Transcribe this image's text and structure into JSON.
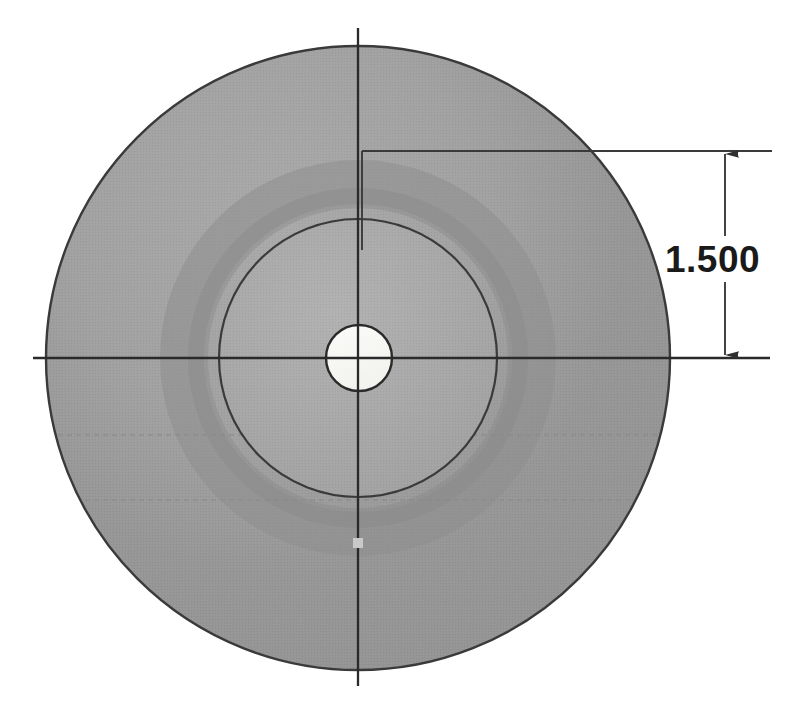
{
  "drawing": {
    "title": "Circular flange hub section view",
    "background_color": "#ffffff",
    "view_type": "front-view"
  },
  "dimension": {
    "value_label": "1.500",
    "units": "in",
    "orientation": "vertical",
    "arrow_style": "filled-closed",
    "text_color": "#1a1a1a",
    "line_color": "#333333"
  },
  "geometry": {
    "center": {
      "x": 358,
      "y": 358
    },
    "outer_circle": {
      "name": "outer-flange-diameter",
      "radius": 312,
      "fill_color": "#9a9a9a",
      "edge_color": "#3a3a3a"
    },
    "boss_circle": {
      "name": "inner-boss-diameter",
      "radius": 139,
      "fill_color": "#a8a8a8",
      "edge_color": "#3a3a3a"
    },
    "center_hole": {
      "name": "center-bore",
      "radius": 22,
      "fill_color": "#f7f7f5",
      "edge_color": "#2a2a2a"
    }
  },
  "centerlines": {
    "vertical": {
      "x": 358,
      "y_start": 28,
      "y_end": 686,
      "color": "#2a2a2a"
    },
    "horizontal": {
      "y": 358,
      "x_start": 33,
      "x_end": 770,
      "color": "#2a2a2a"
    }
  },
  "hidden_lines": [
    {
      "name": "hidden-line-upper",
      "y": 435,
      "color": "#8c8c8c"
    },
    {
      "name": "hidden-line-lower",
      "y": 500,
      "color": "#8c8c8c"
    }
  ],
  "extension_lines": {
    "top": {
      "y": 151,
      "x_start": 362,
      "x_end": 772
    },
    "bottom": {
      "y": 358,
      "x_start": 358,
      "x_end": 772
    },
    "dimension_axis_x": 725,
    "dimension_top_y": 151,
    "dimension_bottom_y": 358
  },
  "colors": {
    "paper": "#ffffff",
    "part_gray": "#9a9a9a",
    "boss_gray": "#a8a8a8",
    "bore_white": "#f7f7f5",
    "line_dark": "#2a2a2a",
    "line_medium": "#555555",
    "hidden_gray": "#8c8c8c"
  }
}
